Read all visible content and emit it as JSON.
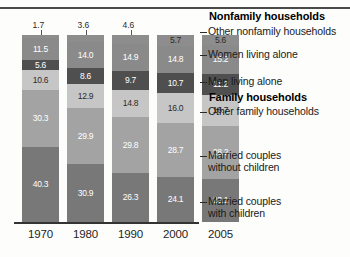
{
  "chart_data": {
    "type": "bar",
    "title": "",
    "subtitle": "",
    "xlabel": "",
    "ylabel": "",
    "ylim": [
      0,
      100
    ],
    "stacked": true,
    "stack_mode": "percent",
    "grid": false,
    "legend_position": "right-callout",
    "categories": [
      "1970",
      "1980",
      "1990",
      "2000",
      "2005"
    ],
    "series": [
      {
        "name": "Other nonfamily households",
        "group": "Nonfamily households",
        "color": "#8d8d8d",
        "text_color": "dark",
        "values": [
          1.7,
          3.6,
          4.6,
          5.7,
          5.6
        ]
      },
      {
        "name": "Women living alone",
        "group": "Nonfamily households",
        "color": "#8a8a8a",
        "text_color": "light",
        "values": [
          11.5,
          14.0,
          14.9,
          14.8,
          15.2
        ]
      },
      {
        "name": "Men living alone",
        "group": "Nonfamily households",
        "color": "#4f4f4f",
        "text_color": "light",
        "values": [
          5.6,
          8.6,
          9.7,
          10.7,
          11.2
        ]
      },
      {
        "name": "Other family households",
        "group": "Family households",
        "color": "#c6c6c6",
        "text_color": "dark",
        "values": [
          10.6,
          12.9,
          14.8,
          16.0,
          16.7
        ]
      },
      {
        "name": "Married couples without children",
        "group": "Family households",
        "color": "#a3a3a3",
        "text_color": "light",
        "values": [
          30.3,
          29.9,
          29.8,
          28.7,
          28.2
        ]
      },
      {
        "name": "Married couples with children",
        "group": "Family households",
        "color": "#787878",
        "text_color": "light",
        "values": [
          40.3,
          30.9,
          26.3,
          24.1,
          23.1
        ]
      }
    ]
  },
  "legend": {
    "headers": [
      {
        "label": "Nonfamily households"
      },
      {
        "label": "Family households"
      }
    ],
    "entries": [
      {
        "label": "Other nonfamily households"
      },
      {
        "label": "Women living alone"
      },
      {
        "label": "Men living alone"
      },
      {
        "label": "Other family households"
      },
      {
        "line1": "Married couples",
        "line2": "without children"
      },
      {
        "line1": "Married couples",
        "line2": "with children"
      }
    ]
  },
  "axis": {
    "years": [
      "1970",
      "1980",
      "1990",
      "2000",
      "2005"
    ]
  }
}
